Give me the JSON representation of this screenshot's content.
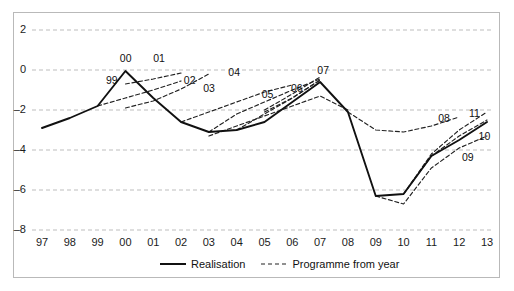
{
  "chart_data": {
    "type": "line",
    "title": "",
    "xlabel": "",
    "ylabel": "",
    "xlim": [
      1997,
      2013
    ],
    "ylim": [
      -8,
      2
    ],
    "grid": true,
    "gridlines_y": [
      2,
      0,
      -2,
      -4,
      -6,
      -8
    ],
    "legend_position": "bottom-center",
    "categories": [
      "97",
      "98",
      "99",
      "00",
      "01",
      "02",
      "03",
      "04",
      "05",
      "06",
      "07",
      "08",
      "09",
      "10",
      "11",
      "12",
      "13"
    ],
    "x": [
      1997,
      1998,
      1999,
      2000,
      2001,
      2002,
      2003,
      2004,
      2005,
      2006,
      2007,
      2008,
      2009,
      2010,
      2011,
      2012,
      2013
    ],
    "series": [
      {
        "name": "Realisation",
        "style": "solid",
        "color": "#111111",
        "x": [
          1997,
          1998,
          1999,
          2000,
          2001,
          2002,
          2003,
          2004,
          2005,
          2006,
          2007,
          2008,
          2009,
          2010,
          2011,
          2012,
          2013
        ],
        "values": [
          -2.9,
          -2.4,
          -1.8,
          -0.05,
          -1.4,
          -2.6,
          -3.1,
          -3.0,
          -2.6,
          -1.6,
          -0.6,
          -2.1,
          -6.3,
          -6.2,
          -4.3,
          -3.5,
          -2.6
        ]
      },
      {
        "name": "Programme from year 99",
        "label": "99",
        "style": "dashed",
        "color": "#222222",
        "x": [
          1999,
          2000,
          2001,
          2002
        ],
        "values": [
          -1.8,
          -1.4,
          -1.0,
          -0.55
        ]
      },
      {
        "name": "Programme from year 00",
        "label": "00",
        "style": "dashed",
        "color": "#222222",
        "x": [
          2000,
          2001,
          2002
        ],
        "values": [
          -0.7,
          -0.45,
          -0.15
        ]
      },
      {
        "name": "Programme from year 01",
        "label": "01",
        "style": "dashed",
        "color": "#222222",
        "x": [
          2000,
          2001,
          2002,
          2003
        ],
        "values": [
          -1.9,
          -1.55,
          -0.95,
          -0.2
        ]
      },
      {
        "name": "Programme from year 02",
        "label": "02",
        "style": "dashed",
        "color": "#222222",
        "x": [
          2002,
          2003,
          2004,
          2005,
          2006
        ],
        "values": [
          -2.6,
          -2.1,
          -1.6,
          -1.1,
          -0.75
        ]
      },
      {
        "name": "Programme from year 03",
        "label": "03",
        "style": "dashed",
        "color": "#222222",
        "x": [
          2003,
          2004,
          2005,
          2006,
          2007
        ],
        "values": [
          -3.1,
          -2.2,
          -1.6,
          -1.0,
          -0.45
        ]
      },
      {
        "name": "Programme from year 04",
        "label": "04",
        "style": "dashed",
        "color": "#222222",
        "x": [
          2004,
          2005,
          2006,
          2007
        ],
        "values": [
          -3.0,
          -2.2,
          -1.4,
          -0.5
        ]
      },
      {
        "name": "Programme from year 05",
        "label": "05",
        "style": "dashed",
        "color": "#222222",
        "x": [
          2003,
          2004,
          2005,
          2006,
          2007,
          2008
        ],
        "values": [
          -3.3,
          -2.8,
          -2.3,
          -1.8,
          -1.3,
          -2.0
        ]
      },
      {
        "name": "Programme from year 06",
        "label": "06",
        "style": "dashed",
        "color": "#222222",
        "x": [
          2005,
          2006,
          2007
        ],
        "values": [
          -2.1,
          -1.4,
          -0.5
        ]
      },
      {
        "name": "Programme from year 07",
        "label": "07",
        "style": "dashed",
        "color": "#222222",
        "x": [
          2005,
          2006,
          2007
        ],
        "values": [
          -2.0,
          -1.2,
          -0.35
        ]
      },
      {
        "name": "Programme from year 08",
        "label": "08",
        "style": "dashed",
        "color": "#222222",
        "x": [
          2008,
          2009,
          2010,
          2011,
          2012
        ],
        "values": [
          -2.1,
          -3.0,
          -3.1,
          -2.8,
          -2.35
        ]
      },
      {
        "name": "Programme from year 09",
        "label": "09",
        "style": "dashed",
        "color": "#222222",
        "x": [
          2009,
          2010,
          2011,
          2012,
          2013
        ],
        "values": [
          -6.3,
          -6.7,
          -4.9,
          -3.9,
          -3.3
        ]
      },
      {
        "name": "Programme from year 10",
        "label": "10",
        "style": "dashed",
        "color": "#222222",
        "x": [
          2010,
          2011,
          2012,
          2013
        ],
        "values": [
          -6.2,
          -4.3,
          -3.3,
          -2.5
        ]
      },
      {
        "name": "Programme from year 11",
        "label": "11",
        "style": "dashed",
        "color": "#222222",
        "x": [
          2010,
          2011,
          2012,
          2013
        ],
        "values": [
          -6.2,
          -4.2,
          -3.0,
          -2.1
        ]
      }
    ]
  },
  "axis": {
    "y_ticks": [
      {
        "label": "2",
        "value": 2
      },
      {
        "label": "0",
        "value": 0
      },
      {
        "label": "–2",
        "value": -2
      },
      {
        "label": "–4",
        "value": -4
      },
      {
        "label": "–6",
        "value": -6
      },
      {
        "label": "–8",
        "value": -8
      }
    ],
    "x_ticks": [
      {
        "label": "97",
        "value": 1997
      },
      {
        "label": "98",
        "value": 1998
      },
      {
        "label": "99",
        "value": 1999
      },
      {
        "label": "00",
        "value": 2000
      },
      {
        "label": "01",
        "value": 2001
      },
      {
        "label": "02",
        "value": 2002
      },
      {
        "label": "03",
        "value": 2003
      },
      {
        "label": "04",
        "value": 2004
      },
      {
        "label": "05",
        "value": 2005
      },
      {
        "label": "06",
        "value": 2006
      },
      {
        "label": "07",
        "value": 2007
      },
      {
        "label": "08",
        "value": 2008
      },
      {
        "label": "09",
        "value": 2009
      },
      {
        "label": "10",
        "value": 2010
      },
      {
        "label": "11",
        "value": 2011
      },
      {
        "label": "12",
        "value": 2012
      },
      {
        "label": "13",
        "value": 2013
      }
    ]
  },
  "annotations": [
    {
      "text": "99",
      "x": 1999.55,
      "y": -0.55
    },
    {
      "text": "00",
      "x": 2000.05,
      "y": 0.55
    },
    {
      "text": "01",
      "x": 2001.25,
      "y": 0.55
    },
    {
      "text": "02",
      "x": 2002.35,
      "y": -0.55
    },
    {
      "text": "03",
      "x": 2003.05,
      "y": -0.95
    },
    {
      "text": "04",
      "x": 2003.95,
      "y": -0.15
    },
    {
      "text": "05",
      "x": 2005.15,
      "y": -1.25
    },
    {
      "text": "06",
      "x": 2006.2,
      "y": -0.95
    },
    {
      "text": "07",
      "x": 2007.15,
      "y": -0.05
    },
    {
      "text": "08",
      "x": 2011.5,
      "y": -2.45
    },
    {
      "text": "09",
      "x": 2012.35,
      "y": -4.4
    },
    {
      "text": "10",
      "x": 2012.95,
      "y": -3.35
    },
    {
      "text": "11",
      "x": 2012.6,
      "y": -2.2
    }
  ],
  "legend": {
    "items": [
      {
        "label": "Realisation",
        "style": "solid"
      },
      {
        "label": "Programme from year",
        "style": "dashed"
      }
    ]
  }
}
